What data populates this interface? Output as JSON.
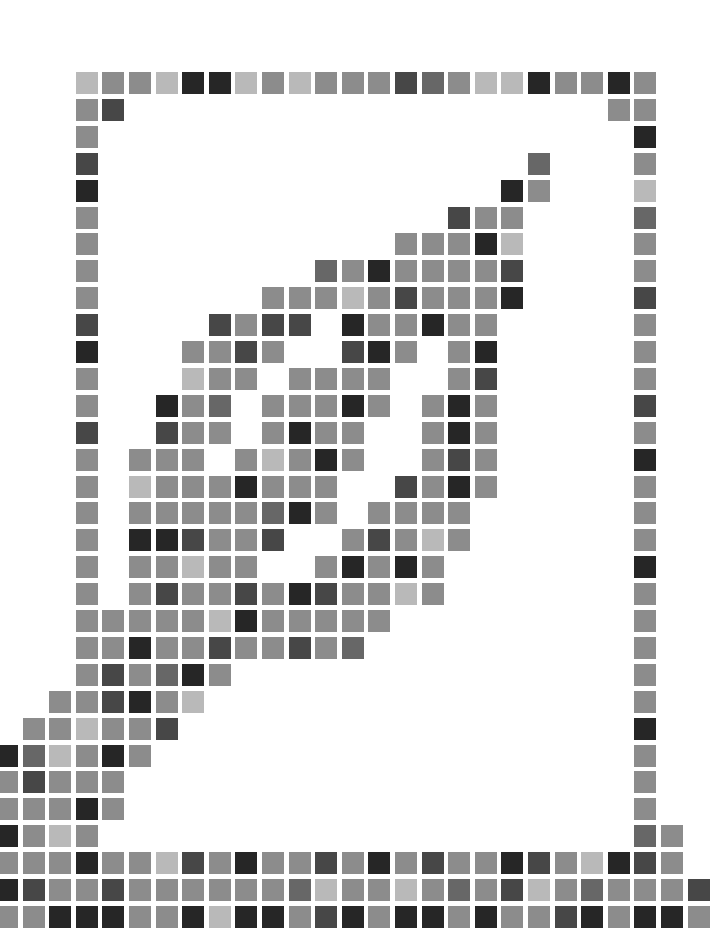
{
  "grid": {
    "origin_x": -4,
    "origin_y": 72,
    "pitch_x": 26.6,
    "pitch_y": 26.9,
    "tile_size": 22,
    "columns": 27,
    "rows_count": 32
  },
  "palette": {
    "L": "#b9b9b9",
    "M": "#8c8c8c",
    "d": "#676767",
    "D": "#474747",
    "K": "#262626"
  },
  "rows": [
    "...LMMLKKLMLMMMDdMLLKMMKM..",
    "...MD..................MM..",
    "...M....................K..",
    "...D................d...M..",
    "...K...............KM...L..",
    "...M.............DMM....d..",
    "...M...........MMMKL....M..",
    "...M........dMKMMMMD....M..",
    "...M......MMMLMDMMMK....D..",
    "...D....DMDD.KMMKMM.....M..",
    "...K...MMDM..DKM.MK.....M..",
    "...M...LMM.MMMM..MD.....M..",
    "...M..KMd.MMMKM.MKM.....D..",
    "...D..DMM.MKMM..MKM.....M..",
    "...M.MMM.MLMKM..MDM.....K..",
    "...M.LMMMKMMM..DMKM.....M..",
    "...M.MMMMMdKM.MMMM......M..",
    "...M.KKDMMD..MDMLM......M..",
    "...M.MMLMM..MKMKM.......K..",
    "...M.MDMMDMKDMMLM.......M..",
    "...MMMMMLKMMMMM.........M..",
    "...MMKMMDMMDMd..........M..",
    "...MDMdKM...............M..",
    "..MMDKML................M..",
    ".MMLMMD.................K..",
    "KdLMKM..................M..",
    "MDMMM...................M..",
    "MMMKM...................M..",
    "KMLM....................dM.",
    "MMMKMMLDMKMMDMKMDMMKDMLKDM.",
    "KDMMDMMMMMMdLMMLMdMDLMdMMMD",
    "MMKKKMMKLKKMDKMKKMKMMDKMKKM"
  ]
}
